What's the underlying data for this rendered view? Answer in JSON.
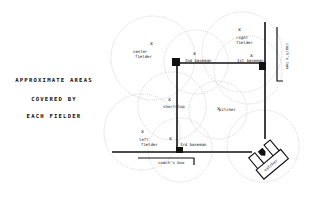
{
  "title": {
    "line1": "APPROXIMATE AREAS",
    "line2": "COVERED BY",
    "line3": "EACH FIELDER"
  },
  "positions": {
    "center_fielder_1": "center",
    "center_fielder_2": "fielder",
    "right_fielder_1": "right",
    "right_fielder_2": "fielder",
    "second_baseman": "2nd baseman",
    "first_baseman": "1st baseman",
    "shortstop": "shortstop",
    "pitcher": "pitcher",
    "left_fielder_1": "left",
    "left_fielder_2": "fielder",
    "third_baseman": "3rd baseman",
    "catcher": "catcher"
  },
  "boxes": {
    "coachs_box_bottom": "coach's box",
    "coachs_box_right": "coach's box"
  },
  "markers": {
    "fielder_mark": "x"
  }
}
